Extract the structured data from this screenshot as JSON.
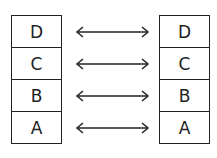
{
  "diagram": {
    "left_stack": {
      "cells": [
        {
          "label": "D"
        },
        {
          "label": "C"
        },
        {
          "label": "B"
        },
        {
          "label": "A"
        }
      ]
    },
    "right_stack": {
      "cells": [
        {
          "label": "D"
        },
        {
          "label": "C"
        },
        {
          "label": "B"
        },
        {
          "label": "A"
        }
      ]
    },
    "connections": [
      {
        "from": "D",
        "to": "D",
        "type": "bidirectional"
      },
      {
        "from": "C",
        "to": "C",
        "type": "bidirectional"
      },
      {
        "from": "B",
        "to": "B",
        "type": "bidirectional"
      },
      {
        "from": "A",
        "to": "A",
        "type": "bidirectional"
      }
    ],
    "colors": {
      "stroke": "#222222",
      "background": "#ffffff"
    }
  }
}
